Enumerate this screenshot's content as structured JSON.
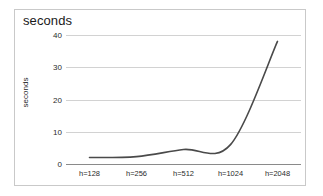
{
  "chart_data": {
    "type": "line",
    "title": "seconds",
    "xlabel": "",
    "ylabel": "seconds",
    "categories": [
      "h=128",
      "h=256",
      "h=512",
      "h=1024",
      "h=2048"
    ],
    "values": [
      2,
      2.3,
      4.5,
      6,
      38
    ],
    "series": [
      {
        "name": "seconds",
        "values": [
          2,
          2.3,
          4.5,
          6,
          38
        ]
      }
    ],
    "yticks": [
      0,
      10,
      20,
      30,
      40
    ],
    "ylim": [
      0,
      40
    ],
    "grid": true,
    "legend": "none",
    "line_color": "#4a4a4a",
    "grid_color": "#d2d2d2",
    "axis_color": "#8a8a8a",
    "background_color": "#ffffff",
    "border_color": "#c9c9c9"
  }
}
